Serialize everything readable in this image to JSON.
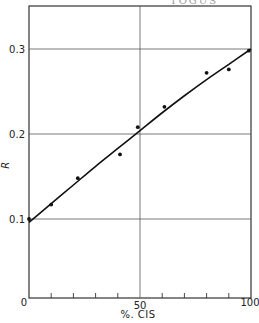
{
  "header": {
    "fragment": "TOGUS"
  },
  "chart_data": {
    "type": "scatter",
    "title": "",
    "xlabel": "%. CIS",
    "ylabel": "R",
    "xlim": [
      0,
      100
    ],
    "ylim": [
      0,
      0.32
    ],
    "grid": true,
    "legend": null,
    "x_ticks": [
      {
        "value": 0,
        "label": "0"
      },
      {
        "value": 50,
        "label": "50"
      },
      {
        "value": 100,
        "label": "100"
      }
    ],
    "x_minor_ticks": [
      10,
      20,
      30,
      40,
      60,
      70,
      80,
      90
    ],
    "y_ticks": [
      {
        "value": 0.1,
        "label": "0.1"
      },
      {
        "value": 0.2,
        "label": "0.2"
      },
      {
        "value": 0.3,
        "label": "0.3"
      }
    ],
    "series": [
      {
        "name": "measured",
        "kind": "scatter",
        "x": [
          0,
          10,
          22,
          41,
          49,
          61,
          80,
          90,
          99
        ],
        "y": [
          0.1,
          0.117,
          0.148,
          0.176,
          0.208,
          0.232,
          0.272,
          0.276,
          0.298
        ]
      },
      {
        "name": "fit",
        "kind": "line",
        "x": [
          0,
          10,
          20,
          30,
          40,
          50,
          60,
          70,
          80,
          90,
          100
        ],
        "y": [
          0.096,
          0.118,
          0.14,
          0.162,
          0.183,
          0.204,
          0.225,
          0.245,
          0.264,
          0.282,
          0.3
        ]
      }
    ]
  }
}
